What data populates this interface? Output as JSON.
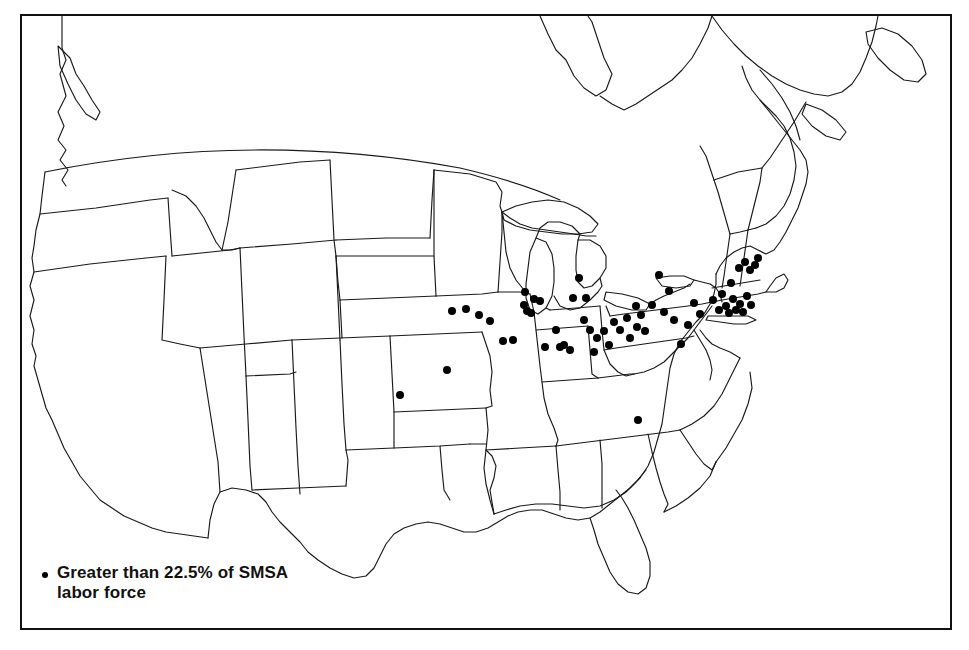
{
  "figure": {
    "kind": "thematic-dot-map",
    "region": "United States",
    "frame": {
      "x": 20,
      "y": 14,
      "width": 932,
      "height": 616,
      "border_color": "#111111"
    },
    "background_color": "#ffffff",
    "outline_color": "#1a1a1a"
  },
  "legend": {
    "symbol": "filled-circle",
    "symbol_color": "#000000",
    "line1": "Greater than 22.5% of SMSA",
    "line2": "labor force",
    "text": "Greater than 22.5% of SMSA\nlabor force",
    "threshold_percent": 22.5,
    "unit": "SMSA labor force"
  },
  "chart_data": {
    "type": "scatter",
    "title": "",
    "xlabel": "",
    "ylabel": "",
    "projection": "pixel-approximate United States outline",
    "symbol": "filled black circle",
    "symbol_radius_px": 4,
    "series": [
      {
        "name": "Greater than 22.5% of SMSA labor force",
        "color": "#000000",
        "count": 63,
        "points": [
          [
            466,
            309
          ],
          [
            452,
            311
          ],
          [
            479,
            315
          ],
          [
            447,
            370
          ],
          [
            400,
            395
          ],
          [
            490,
            321
          ],
          [
            503,
            341
          ],
          [
            513,
            340
          ],
          [
            525,
            292
          ],
          [
            524,
            305
          ],
          [
            527,
            311
          ],
          [
            531,
            313
          ],
          [
            534,
            299
          ],
          [
            540,
            301
          ],
          [
            545,
            347
          ],
          [
            556,
            330
          ],
          [
            560,
            347
          ],
          [
            564,
            345
          ],
          [
            570,
            350
          ],
          [
            573,
            298
          ],
          [
            579,
            278
          ],
          [
            586,
            298
          ],
          [
            590,
            330
          ],
          [
            597,
            338
          ],
          [
            594,
            352
          ],
          [
            584,
            320
          ],
          [
            604,
            331
          ],
          [
            609,
            345
          ],
          [
            614,
            322
          ],
          [
            620,
            330
          ],
          [
            627,
            318
          ],
          [
            630,
            338
          ],
          [
            636,
            306
          ],
          [
            637,
            327
          ],
          [
            641,
            315
          ],
          [
            645,
            331
          ],
          [
            652,
            305
          ],
          [
            659,
            275
          ],
          [
            664,
            312
          ],
          [
            669,
            291
          ],
          [
            674,
            320
          ],
          [
            681,
            344
          ],
          [
            688,
            325
          ],
          [
            694,
            303
          ],
          [
            700,
            314
          ],
          [
            638,
            420
          ],
          [
            713,
            300
          ],
          [
            719,
            310
          ],
          [
            722,
            294
          ],
          [
            726,
            306
          ],
          [
            729,
            313
          ],
          [
            733,
            299
          ],
          [
            736,
            310
          ],
          [
            740,
            304
          ],
          [
            743,
            312
          ],
          [
            747,
            296
          ],
          [
            751,
            305
          ],
          [
            739,
            268
          ],
          [
            745,
            262
          ],
          [
            750,
            270
          ],
          [
            755,
            265
          ],
          [
            731,
            283
          ],
          [
            758,
            258
          ]
        ]
      }
    ]
  }
}
